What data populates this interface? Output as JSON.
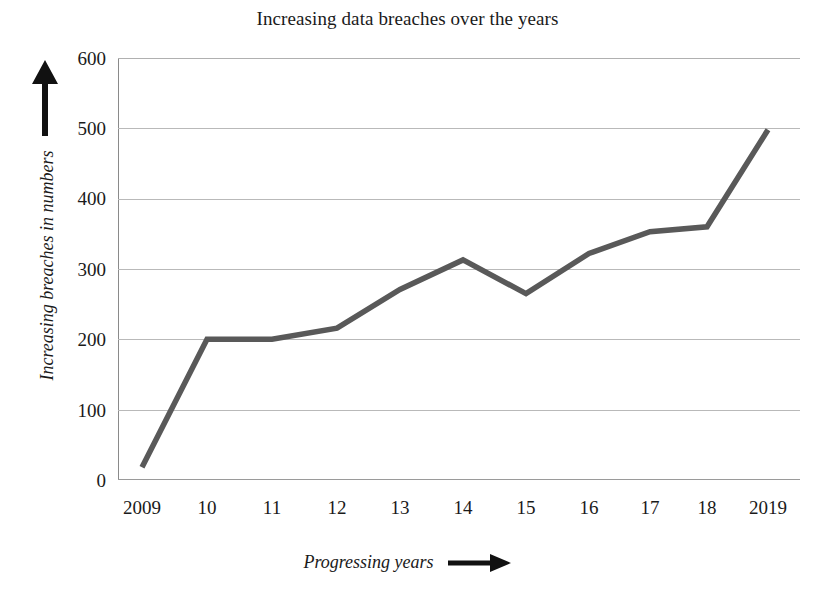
{
  "chart_data": {
    "type": "line",
    "title": "Increasing data breaches over the years",
    "xlabel": "Progressing years",
    "ylabel": "Increasing breaches in numbers",
    "categories": [
      "2009",
      "10",
      "11",
      "12",
      "13",
      "14",
      "15",
      "16",
      "17",
      "18",
      "2019"
    ],
    "values": [
      18,
      200,
      200,
      216,
      271,
      313,
      265,
      322,
      353,
      360,
      498
    ],
    "series": [
      {
        "name": "Data breaches",
        "values": [
          18,
          200,
          200,
          216,
          271,
          313,
          265,
          322,
          353,
          360,
          498
        ]
      }
    ],
    "ylim": [
      0,
      600
    ],
    "yticks": [
      0,
      100,
      200,
      300,
      400,
      500,
      600
    ],
    "ytick_labels": [
      "0",
      "100",
      "200",
      "300",
      "400",
      "500",
      "600"
    ],
    "grid": true,
    "legend": false,
    "legend_position": "none",
    "line_color": "#595959",
    "grid_color": "#b9b9b9",
    "axis_color": "#8a8a8a",
    "background_color": "#ffffff",
    "text_color": "#1a1a1a",
    "annotations": {
      "y_axis_arrow": "up-arrow",
      "x_axis_arrow": "right-arrow"
    }
  }
}
